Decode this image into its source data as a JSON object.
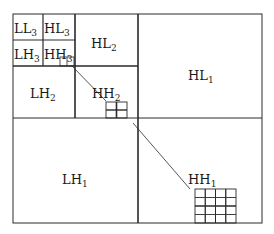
{
  "diagram": {
    "subbands": {
      "LL3": {
        "base": "LL",
        "sub": "3"
      },
      "HL3": {
        "base": "HL",
        "sub": "3"
      },
      "LH3": {
        "base": "LH",
        "sub": "3"
      },
      "HH3": {
        "base": "HH",
        "sub": "3"
      },
      "HL2": {
        "base": "HL",
        "sub": "2"
      },
      "LH2": {
        "base": "LH",
        "sub": "2"
      },
      "HH2": {
        "base": "HH",
        "sub": "2"
      },
      "HL1": {
        "base": "HL",
        "sub": "1"
      },
      "LH1": {
        "base": "LH",
        "sub": "1"
      },
      "HH1": {
        "base": "HH",
        "sub": "1"
      }
    },
    "colors": {
      "line": "#2a2a2a",
      "background": "#ffffff"
    }
  }
}
